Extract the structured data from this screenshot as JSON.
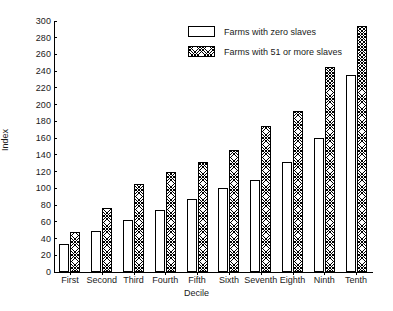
{
  "chart_data": {
    "type": "bar",
    "title": "",
    "xlabel": "Decile",
    "ylabel": "Index",
    "categories": [
      "First",
      "Second",
      "Third",
      "Fourth",
      "Fifth",
      "Sixth",
      "Seventh",
      "Eighth",
      "Ninth",
      "Tenth"
    ],
    "series": [
      {
        "name": "Farms with zero slaves",
        "values": [
          33,
          49,
          62,
          74,
          87,
          100,
          110,
          131,
          160,
          236
        ]
      },
      {
        "name": "Farms with 51 or more slaves",
        "values": [
          48,
          77,
          105,
          119,
          131,
          146,
          174,
          193,
          245,
          294
        ]
      }
    ],
    "ylim": [
      0,
      300
    ],
    "ytick_labels": [
      "0",
      "20",
      "40",
      "60",
      "80",
      "100",
      "120",
      "140",
      "160",
      "180",
      "200",
      "220",
      "240",
      "260",
      "280",
      "300"
    ],
    "ytick_values": [
      0,
      20,
      40,
      60,
      80,
      100,
      120,
      140,
      160,
      180,
      200,
      220,
      240,
      260,
      280,
      300
    ],
    "grid": false,
    "legend_position": "top-right"
  },
  "legend": {
    "entries": [
      {
        "label": "Farms with zero slaves",
        "swatch": "open-rectangle-swatch"
      },
      {
        "label": "Farms with 51 or more slaves",
        "swatch": "hatched-rectangle-swatch"
      }
    ]
  },
  "colors": {
    "axis": "#000000",
    "bar_zero_fill": "#ffffff",
    "bar_many_fill": "#ffffff",
    "bar_stroke": "#000000",
    "background": "#ffffff"
  }
}
